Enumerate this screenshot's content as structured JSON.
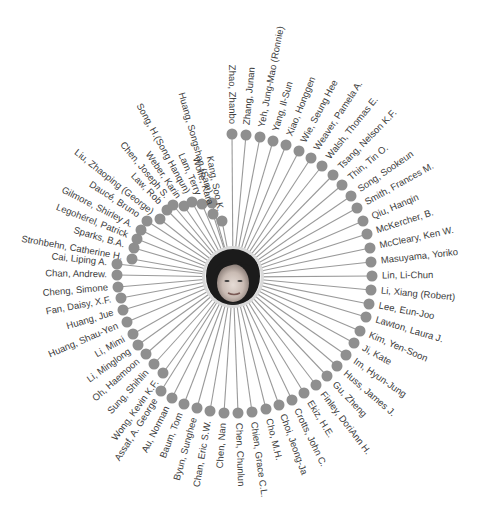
{
  "diagram": {
    "type": "radial-network",
    "center_person": {
      "photo": "portrait-photo",
      "cx": 233,
      "cy": 277,
      "radius": 30
    },
    "ring_radius": 130,
    "label_offset": 10,
    "colors": {
      "node": "#8f8f8f",
      "stem": "#9a9a9a",
      "label": "#3c3c3c",
      "background": "#ffffff"
    },
    "nodes": [
      {
        "name": "Zhao, Zhanbo",
        "x": 232,
        "y": 134
      },
      {
        "name": "Zhang, Junan",
        "x": 246,
        "y": 135
      },
      {
        "name": "Yeh, Jung-Mao (Ronnie)",
        "x": 260,
        "y": 137
      },
      {
        "name": "Yang, Il-Sun",
        "x": 273,
        "y": 141
      },
      {
        "name": "Xiao, Honggen",
        "x": 286,
        "y": 145
      },
      {
        "name": "Wie, Seung Hee",
        "x": 299,
        "y": 151
      },
      {
        "name": "Weaver, Pamela A.",
        "x": 311,
        "y": 158
      },
      {
        "name": "Walsh, Thomas E.",
        "x": 322,
        "y": 166
      },
      {
        "name": "Tsang, Nelson K.F.",
        "x": 333,
        "y": 175
      },
      {
        "name": "Thin, Tin O.",
        "x": 342,
        "y": 185
      },
      {
        "name": "Song, Sookeun",
        "x": 351,
        "y": 196
      },
      {
        "name": "Smith, Frances M.",
        "x": 357,
        "y": 208
      },
      {
        "name": "Qiu, Hanqin",
        "x": 363,
        "y": 221
      },
      {
        "name": "McKercher, B.",
        "x": 367,
        "y": 234
      },
      {
        "name": "McCleary, Ken W.",
        "x": 370,
        "y": 248
      },
      {
        "name": "Masuyama, Yoriko",
        "x": 371,
        "y": 262
      },
      {
        "name": "Lin, Li-Chun",
        "x": 372,
        "y": 276
      },
      {
        "name": "Li, Xiang (Robert)",
        "x": 371,
        "y": 290
      },
      {
        "name": "Lee, Eun-Joo",
        "x": 369,
        "y": 304
      },
      {
        "name": "Lawton, Laura J.",
        "x": 366,
        "y": 317
      },
      {
        "name": "Kim, Yen-Soon",
        "x": 360,
        "y": 331
      },
      {
        "name": "Ji, Kate",
        "x": 354,
        "y": 343
      },
      {
        "name": "Im, Hyun-Jung",
        "x": 346,
        "y": 355
      },
      {
        "name": "Huss, James J.",
        "x": 337,
        "y": 366
      },
      {
        "name": "Gu, Zheng",
        "x": 327,
        "y": 376
      },
      {
        "name": "Finley, DoriAnn H.",
        "x": 316,
        "y": 385
      },
      {
        "name": "Ekiz, H.E.",
        "x": 304,
        "y": 393
      },
      {
        "name": "Crotts, John C.",
        "x": 292,
        "y": 400
      },
      {
        "name": "Choi, Jeong-Ja",
        "x": 279,
        "y": 405
      },
      {
        "name": "Cho, M.H.",
        "x": 266,
        "y": 409
      },
      {
        "name": "Chien, Grace C.L.",
        "x": 252,
        "y": 412
      },
      {
        "name": "Chen, Chunlun",
        "x": 238,
        "y": 413
      },
      {
        "name": "Chen, Nan",
        "x": 224,
        "y": 413
      },
      {
        "name": "Chan, Eric S.W.",
        "x": 210,
        "y": 411
      },
      {
        "name": "Byun, Sunghee",
        "x": 197,
        "y": 408
      },
      {
        "name": "Baum, Tom",
        "x": 184,
        "y": 404
      },
      {
        "name": "Au, Norman",
        "x": 172,
        "y": 398
      },
      {
        "name": "Assaf, A. George",
        "x": 161,
        "y": 391
      },
      {
        "name": "Wong, Kevin K.F.",
        "x": 163,
        "y": 373
      },
      {
        "name": "Sung, Shihlin",
        "x": 154,
        "y": 364
      },
      {
        "name": "Oh, Haemoon",
        "x": 146,
        "y": 354
      },
      {
        "name": "Li, Minglong",
        "x": 138,
        "y": 345
      },
      {
        "name": "Li, Mimi",
        "x": 133,
        "y": 334
      },
      {
        "name": "Huang, Shau-Yen",
        "x": 127,
        "y": 322
      },
      {
        "name": "Huang, Jue",
        "x": 123,
        "y": 310
      },
      {
        "name": "Fan, Daisy, X.F.",
        "x": 121,
        "y": 298
      },
      {
        "name": "Cheng, Simone",
        "x": 118,
        "y": 287
      },
      {
        "name": "Chan, Andrew.",
        "x": 117,
        "y": 275
      },
      {
        "name": "Cai, Liping A.",
        "x": 117,
        "y": 264
      },
      {
        "name": "Strohbehn, Catherine H.",
        "x": 132,
        "y": 259
      },
      {
        "name": "Sparks, B.A.",
        "x": 134,
        "y": 248
      },
      {
        "name": "Legohérel, Patrick",
        "x": 137,
        "y": 239
      },
      {
        "name": "Gilmore, Shirley A.",
        "x": 141,
        "y": 230
      },
      {
        "name": "Daucé, Bruno",
        "x": 147,
        "y": 221
      },
      {
        "name": "Liu, Zhaoping (George)",
        "x": 160,
        "y": 219
      },
      {
        "name": "Law, Rob",
        "x": 167,
        "y": 210
      },
      {
        "name": "Chen, Joseph S.",
        "x": 173,
        "y": 205
      },
      {
        "name": "Weber, Karin",
        "x": 184,
        "y": 206
      },
      {
        "name": "Song, H.(Song Hanqun)",
        "x": 192,
        "y": 202
      },
      {
        "name": "Lam, Terry",
        "x": 202,
        "y": 204
      },
      {
        "name": "Huang, Songshan (Sam)",
        "x": 212,
        "y": 203
      },
      {
        "name": "Wolfe, Kara",
        "x": 213,
        "y": 214
      },
      {
        "name": "Kang, Soo K.",
        "x": 222,
        "y": 221
      }
    ]
  }
}
